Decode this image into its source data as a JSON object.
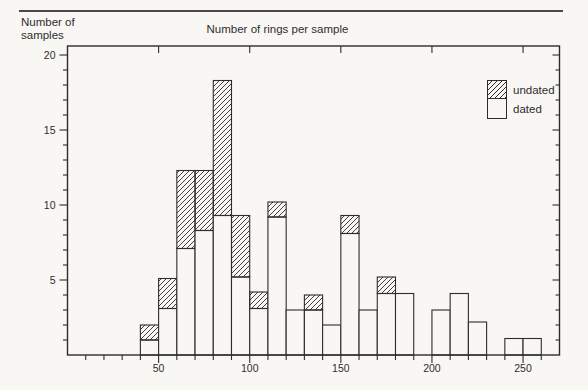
{
  "chart_data": {
    "type": "bar",
    "subtype": "stacked-histogram",
    "title": "Number of rings per sample",
    "ylabel": "Number of samples",
    "xlabel": "",
    "bin_width": 10,
    "bin_starts": [
      40,
      50,
      60,
      70,
      80,
      90,
      100,
      110,
      120,
      130,
      140,
      150,
      160,
      170,
      180,
      190,
      200,
      210,
      220,
      230,
      240,
      250
    ],
    "series": [
      {
        "name": "dated",
        "pattern": "plain",
        "values": [
          1.0,
          3.1,
          7.1,
          8.3,
          9.3,
          5.2,
          3.1,
          9.2,
          3.0,
          3.0,
          2.0,
          8.1,
          3.0,
          4.1,
          4.1,
          0,
          3.0,
          4.1,
          2.2,
          0,
          1.1,
          1.1
        ]
      },
      {
        "name": "undated",
        "pattern": "hatch",
        "values": [
          1.0,
          2.0,
          5.2,
          4.0,
          9.0,
          4.1,
          1.1,
          1.0,
          0,
          1.0,
          0,
          1.2,
          0,
          1.1,
          0,
          0,
          0,
          0,
          0,
          0,
          0,
          0
        ]
      }
    ],
    "totals": [
      2.0,
      5.1,
      12.3,
      12.3,
      18.3,
      9.3,
      4.2,
      10.2,
      3.0,
      4.0,
      2.0,
      9.3,
      3.0,
      5.2,
      4.1,
      0,
      3.0,
      4.1,
      2.2,
      0,
      1.1,
      1.1
    ],
    "legend": [
      {
        "label": "undated",
        "pattern": "hatch"
      },
      {
        "label": "dated",
        "pattern": "plain"
      }
    ],
    "legend_position": "upper-right-inside",
    "xlim": [
      0,
      270
    ],
    "ylim": [
      0,
      20.6
    ],
    "x_major_ticks": [
      50,
      100,
      150,
      200,
      250
    ],
    "x_minor_step": 10,
    "y_major_ticks": [
      5,
      10,
      15,
      20
    ],
    "y_minor_step": 1,
    "grid": false,
    "colors": {
      "ink": "#2e2d2b",
      "background": "#f8f7f4",
      "bar_fill": "#f8f7f4"
    }
  }
}
